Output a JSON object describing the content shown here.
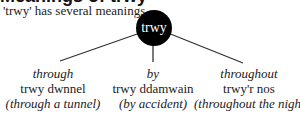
{
  "heading_partial": "Meanings of trwy",
  "subtitle": "'trwy' has several meanings",
  "root": "trwy",
  "branches": [
    {
      "meaning": "through",
      "example": "trwy dwnnel",
      "gloss": "(through a tunnel)"
    },
    {
      "meaning": "by",
      "example": "trwy ddamwain",
      "gloss": "(by accident)"
    },
    {
      "meaning": "throughout",
      "example": "trwy'r nos",
      "gloss": "(throughout the night)"
    }
  ]
}
